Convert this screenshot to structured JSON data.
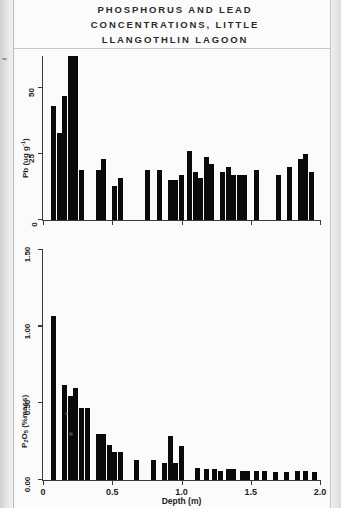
{
  "caption": {
    "line1": "PHOSPHORUS AND LEAD",
    "line2": "CONCENTRATIONS, LITTLE",
    "line3": "LLANGOTHLIN LAGOON"
  },
  "axis": {
    "x_title": "Depth (m)",
    "x_ticks": [
      "0",
      "0.5",
      "1.0",
      "1.5",
      "2.0"
    ],
    "pb_y_ticks": [
      "0",
      "25",
      "50"
    ],
    "p_y_ticks": [
      "0.00",
      "0.50",
      "1.00",
      "1.50"
    ]
  },
  "chart_data": [
    {
      "type": "bar",
      "title": "PHOSPHORUS AND LEAD CONCENTRATIONS, LITTLE LLANGOTHLIN LAGOON",
      "panel": "top",
      "xlabel": "Depth (m)",
      "ylabel": "Pb (ug g-1)",
      "ylabel_html": "Pb (ug g<sup>-1</sup>)",
      "xlim": [
        0,
        2.0
      ],
      "ylim": [
        0,
        62
      ],
      "yticks": [
        0,
        25,
        50
      ],
      "xticks": [
        0,
        0.5,
        1.0,
        1.5,
        2.0
      ],
      "grid": false,
      "legend": "none",
      "bar_color": "#0a0a0a",
      "x": [
        0.02,
        0.06,
        0.1,
        0.14,
        0.18,
        0.22,
        0.26,
        0.3,
        0.38,
        0.42,
        0.46,
        0.5,
        0.54,
        0.7,
        0.74,
        0.82,
        0.86,
        0.9,
        0.94,
        0.98,
        1.04,
        1.08,
        1.12,
        1.16,
        1.2,
        1.24,
        1.28,
        1.32,
        1.36,
        1.4,
        1.44,
        1.52,
        1.6,
        1.68,
        1.76,
        1.84,
        1.88,
        1.92
      ],
      "values": [
        0,
        43,
        33,
        47,
        62,
        62,
        19,
        0,
        19,
        23,
        0,
        13,
        16,
        0,
        19,
        19,
        0,
        15,
        15,
        17,
        26,
        18,
        16,
        24,
        21,
        0,
        18,
        20,
        17,
        17,
        17,
        19,
        0,
        17,
        20,
        23,
        25,
        18
      ],
      "notes": "Tallest bars near 0.18-0.22 m are clipped at top of plot frame"
    },
    {
      "type": "bar",
      "panel": "bottom",
      "xlabel": "Depth (m)",
      "ylabel": "P2O5 (%mass)",
      "ylabel_html": "P<sub>2</sub>O<sub>5</sub> (%mass)",
      "xlim": [
        0,
        2.0
      ],
      "ylim": [
        0.0,
        1.5
      ],
      "yticks": [
        0.0,
        0.5,
        1.0,
        1.5
      ],
      "xticks": [
        0,
        0.5,
        1.0,
        1.5,
        2.0
      ],
      "grid": false,
      "legend": "none",
      "bar_color": "#0a0a0a",
      "x": [
        0.02,
        0.06,
        0.1,
        0.14,
        0.18,
        0.22,
        0.26,
        0.3,
        0.34,
        0.38,
        0.42,
        0.46,
        0.5,
        0.54,
        0.62,
        0.66,
        0.74,
        0.78,
        0.86,
        0.9,
        0.94,
        0.98,
        1.06,
        1.1,
        1.16,
        1.22,
        1.26,
        1.32,
        1.36,
        1.42,
        1.46,
        1.52,
        1.58,
        1.66,
        1.74,
        1.82,
        1.88,
        1.94
      ],
      "values": [
        0.0,
        1.07,
        0.0,
        0.62,
        0.55,
        0.6,
        0.47,
        0.47,
        0.0,
        0.3,
        0.3,
        0.23,
        0.18,
        0.18,
        0.0,
        0.13,
        0.0,
        0.13,
        0.11,
        0.29,
        0.11,
        0.22,
        0.0,
        0.08,
        0.07,
        0.07,
        0.06,
        0.07,
        0.07,
        0.06,
        0.06,
        0.06,
        0.06,
        0.05,
        0.05,
        0.06,
        0.06,
        0.05
      ]
    }
  ]
}
